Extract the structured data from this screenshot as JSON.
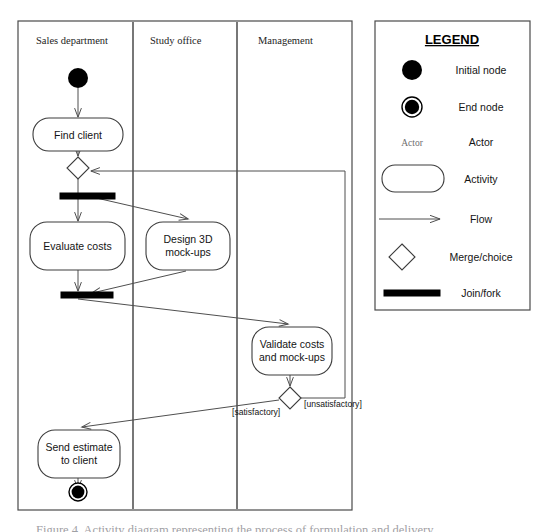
{
  "diagram": {
    "type": "uml-activity-diagram",
    "frame": {
      "x": 18,
      "y": 21,
      "width": 334,
      "height": 489
    },
    "swimlanes": [
      {
        "id": "sales",
        "title": "Sales department",
        "x": 18,
        "width": 115
      },
      {
        "id": "study",
        "title": "Study office",
        "x": 133,
        "width": 104
      },
      {
        "id": "management",
        "title": "Management",
        "x": 237,
        "width": 115
      }
    ],
    "nodes": [
      {
        "id": "start",
        "kind": "initial-node",
        "lane": "sales",
        "cx": 78,
        "cy": 78,
        "r": 10
      },
      {
        "id": "find-client",
        "kind": "activity",
        "lane": "sales",
        "label": "Find client",
        "x": 33,
        "y": 118,
        "width": 90,
        "height": 33
      },
      {
        "id": "merge",
        "kind": "merge",
        "lane": "sales",
        "cx": 78,
        "cy": 168,
        "half": 11
      },
      {
        "id": "fork",
        "kind": "fork-bar",
        "lane": "sales",
        "x": 60,
        "y": 193,
        "width": 55,
        "height": 6
      },
      {
        "id": "evaluate-costs",
        "kind": "activity",
        "lane": "sales",
        "label": "Evaluate costs",
        "x": 30,
        "y": 222,
        "width": 95,
        "height": 48
      },
      {
        "id": "design-mockups",
        "kind": "activity",
        "lane": "study",
        "label": "Design 3D\nmock-ups",
        "x": 146,
        "y": 222,
        "width": 84,
        "height": 48
      },
      {
        "id": "join",
        "kind": "join-bar",
        "lane": "sales",
        "x": 61,
        "y": 292,
        "width": 52,
        "height": 6
      },
      {
        "id": "validate",
        "kind": "activity",
        "lane": "management",
        "label": "Validate costs\nand mock-ups",
        "x": 252,
        "y": 327,
        "width": 80,
        "height": 48
      },
      {
        "id": "decision",
        "kind": "choice",
        "lane": "management",
        "cx": 290,
        "cy": 398,
        "half": 11
      },
      {
        "id": "send-estimate",
        "kind": "activity",
        "lane": "sales",
        "label": "Send estimate\nto client",
        "x": 38,
        "y": 430,
        "width": 82,
        "height": 48
      },
      {
        "id": "end",
        "kind": "end-node",
        "lane": "sales",
        "cx": 78,
        "cy": 492,
        "r": 9
      }
    ],
    "flows": [
      {
        "from": "start",
        "to": "find-client",
        "guard": ""
      },
      {
        "from": "find-client",
        "to": "merge",
        "guard": ""
      },
      {
        "from": "merge",
        "to": "fork",
        "guard": ""
      },
      {
        "from": "fork",
        "to": "evaluate-costs",
        "guard": ""
      },
      {
        "from": "fork",
        "to": "design-mockups",
        "guard": ""
      },
      {
        "from": "evaluate-costs",
        "to": "join",
        "guard": ""
      },
      {
        "from": "design-mockups",
        "to": "join",
        "guard": ""
      },
      {
        "from": "join",
        "to": "validate",
        "guard": ""
      },
      {
        "from": "validate",
        "to": "decision",
        "guard": ""
      },
      {
        "from": "decision",
        "to": "send-estimate",
        "guard": "[satisfactory]"
      },
      {
        "from": "decision",
        "to": "merge",
        "guard": "[unsatisfactory]"
      },
      {
        "from": "send-estimate",
        "to": "end",
        "guard": ""
      }
    ],
    "guards": [
      {
        "id": "guard-satisfactory",
        "text": "[satisfactory]",
        "x": 232,
        "y": 415
      },
      {
        "id": "guard-unsatisfactory",
        "text": "[unsatisfactory]",
        "x": 304,
        "y": 407
      }
    ],
    "node_labels": {
      "find_client": "Find client",
      "evaluate_costs": "Evaluate costs",
      "design_mockups_line1": "Design 3D",
      "design_mockups_line2": "mock-ups",
      "validate_line1": "Validate costs",
      "validate_line2": "and mock-ups",
      "send_estimate_line1": "Send estimate",
      "send_estimate_line2": "to client"
    }
  },
  "legend": {
    "title": "LEGEND",
    "box": {
      "x": 375,
      "y": 21,
      "width": 155,
      "height": 289
    },
    "items": [
      {
        "symbol": "initial-node",
        "label": "Initial node"
      },
      {
        "symbol": "end-node",
        "label": "End node"
      },
      {
        "symbol": "actor",
        "symbol_text": "Actor",
        "label": "Actor"
      },
      {
        "symbol": "activity",
        "label": "Activity"
      },
      {
        "symbol": "flow-arrow",
        "label": "Flow"
      },
      {
        "symbol": "merge-diamond",
        "label": "Merge/choice"
      },
      {
        "symbol": "join-bar",
        "label": "Join/fork"
      }
    ]
  },
  "caption": {
    "text": "Figure 4. Activity diagram representing the process of formulation and delivery"
  },
  "colors": {
    "stroke": "#4a4a4a",
    "node_stroke": "#3c3c3c",
    "fill": "#ffffff",
    "bar": "#000000",
    "text": "#141414",
    "caption_text": "#9fa0a4"
  }
}
